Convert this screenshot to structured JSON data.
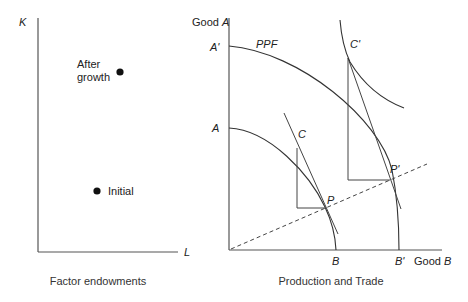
{
  "left_panel": {
    "y_axis_label": "K",
    "x_axis_label": "L",
    "caption": "Factor endowments",
    "points": [
      {
        "name": "after-growth",
        "label_line1": "After",
        "label_line2": "growth",
        "x": 120,
        "y": 72
      },
      {
        "name": "initial",
        "label": "Initial",
        "x": 97,
        "y": 191
      }
    ]
  },
  "right_panel": {
    "y_axis_label_prefix": "Good ",
    "y_axis_label_var": "A",
    "x_axis_label_prefix": "Good ",
    "x_axis_label_var": "B",
    "caption": "Production and Trade",
    "curve_label": "PPF",
    "intercepts": {
      "a_prime": "A'",
      "a": "A",
      "b": "B",
      "b_prime": "B'"
    },
    "points": {
      "c": "C",
      "c_prime": "C'",
      "p": "P",
      "p_prime": "P'"
    }
  },
  "colors": {
    "line": "#333333",
    "axis": "#555555",
    "text": "#222222",
    "background": "#ffffff"
  }
}
